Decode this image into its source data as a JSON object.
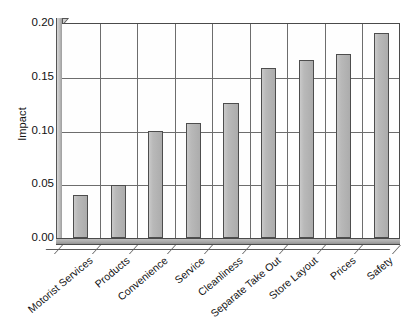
{
  "chart_data": {
    "type": "bar",
    "title": "",
    "subtitle": "",
    "xlabel": "",
    "ylabel": "Impact",
    "categories": [
      "Motorist Services",
      "Products",
      "Convenience",
      "Service",
      "Cleanliness",
      "Separate Take Out",
      "Store Layout",
      "Prices",
      "Safety"
    ],
    "values": [
      0.04,
      0.049,
      0.1,
      0.107,
      0.126,
      0.158,
      0.166,
      0.171,
      0.191
    ],
    "ylim": [
      0.0,
      0.2
    ],
    "yticks": [
      0.0,
      0.05,
      0.1,
      0.15,
      0.2
    ],
    "ytick_labels": [
      "0.00",
      "0.05",
      "0.10",
      "0.15",
      "0.20"
    ],
    "grid": true,
    "grid_axis": "both",
    "legend": false,
    "legend_position": "none",
    "bar_color": "#b4b4b4",
    "bar_edge_color": "#4d4d4d",
    "axis_color": "#4a4a4a",
    "grid_color": "#6d6d6d",
    "background_color": "#ffffff",
    "label_rotation": -40,
    "style": "3d-base"
  }
}
